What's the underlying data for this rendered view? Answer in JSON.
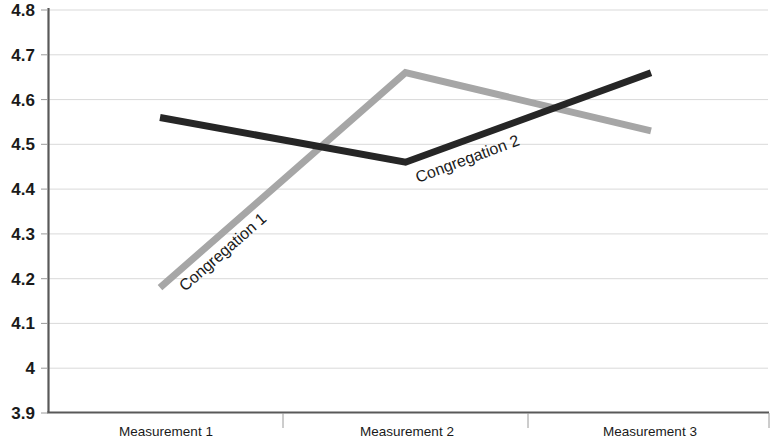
{
  "chart_data": {
    "type": "line",
    "title": "",
    "xlabel": "",
    "ylabel": "",
    "categories": [
      "Measurement 1",
      "Measurement 2",
      "Measurement 3"
    ],
    "ylim": [
      3.9,
      4.8
    ],
    "ytick_labels": [
      "4.8",
      "4.7",
      "4.6",
      "4.5",
      "4.4",
      "4.3",
      "4.2",
      "4.1",
      "4",
      "3.9"
    ],
    "ytick_values": [
      4.8,
      4.7,
      4.6,
      4.5,
      4.4,
      4.3,
      4.2,
      4.1,
      4.0,
      3.9
    ],
    "grid": true,
    "legend_position": "inline-labels",
    "series": [
      {
        "name": "Congregation 1",
        "color": "#a6a6a6",
        "values": [
          4.18,
          4.66,
          4.53
        ]
      },
      {
        "name": "Congregation 2",
        "color": "#262626",
        "values": [
          4.56,
          4.46,
          4.66
        ]
      }
    ],
    "annotations": [
      {
        "text": "Congregation 1",
        "series": "Congregation 1"
      },
      {
        "text": "Congregation 2",
        "series": "Congregation 2"
      }
    ]
  },
  "axes": {
    "y_tick_0": "4.8",
    "y_tick_1": "4.7",
    "y_tick_2": "4.6",
    "y_tick_3": "4.5",
    "y_tick_4": "4.4",
    "y_tick_5": "4.3",
    "y_tick_6": "4.2",
    "y_tick_7": "4.1",
    "y_tick_8": "4",
    "y_tick_9": "3.9",
    "x_cat_0": "Measurement 1",
    "x_cat_1": "Measurement 2",
    "x_cat_2": "Measurement 3"
  },
  "colors": {
    "series_1": "#a6a6a6",
    "series_2": "#262626",
    "axis": "#595959",
    "grid": "#d9d9d9",
    "background": "#ffffff"
  },
  "labels": {
    "series_1_label": "Congregation 1",
    "series_2_label": "Congregation 2"
  }
}
